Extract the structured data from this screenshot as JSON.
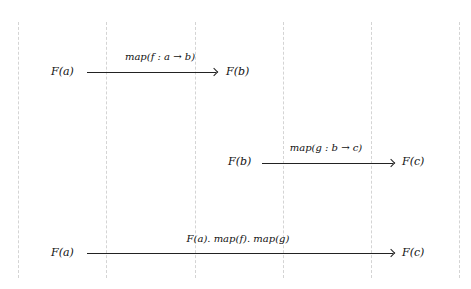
{
  "diagram": {
    "gridlines_x": [
      18,
      106,
      195,
      283,
      371,
      459
    ],
    "rows": [
      {
        "source": "F(a)",
        "target": "F(b)",
        "label": "map(f : a → b)"
      },
      {
        "source": "F(b)",
        "target": "F(c)",
        "label": "map(g : b → c)"
      },
      {
        "source": "F(a)",
        "target": "F(c)",
        "label": "F(a). map(f). map(g)"
      }
    ],
    "colors": {
      "gridline": "#d4d4d4",
      "arrow": "#222222",
      "text": "#111111"
    }
  }
}
